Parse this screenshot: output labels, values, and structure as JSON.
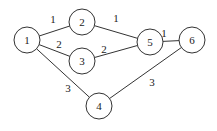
{
  "graph": {
    "nodes": [
      {
        "id": "1",
        "label": "1",
        "x": 27,
        "y": 40
      },
      {
        "id": "2",
        "label": "2",
        "x": 82,
        "y": 22
      },
      {
        "id": "3",
        "label": "3",
        "x": 82,
        "y": 61
      },
      {
        "id": "4",
        "label": "4",
        "x": 99,
        "y": 106
      },
      {
        "id": "5",
        "label": "5",
        "x": 150,
        "y": 42
      },
      {
        "id": "6",
        "label": "6",
        "x": 192,
        "y": 40
      }
    ],
    "edges": [
      {
        "from": "1",
        "to": "2",
        "weight": "1",
        "lx": 53,
        "ly": 23
      },
      {
        "from": "1",
        "to": "3",
        "weight": "2",
        "lx": 59,
        "ly": 48
      },
      {
        "from": "1",
        "to": "4",
        "weight": "3",
        "lx": 68,
        "ly": 92
      },
      {
        "from": "2",
        "to": "5",
        "weight": "1",
        "lx": 116,
        "ly": 22
      },
      {
        "from": "3",
        "to": "5",
        "weight": "2",
        "lx": 104,
        "ly": 53
      },
      {
        "from": "5",
        "to": "6",
        "weight": "1",
        "lx": 164,
        "ly": 37
      },
      {
        "from": "4",
        "to": "6",
        "weight": "3",
        "lx": 152,
        "ly": 86
      }
    ]
  }
}
